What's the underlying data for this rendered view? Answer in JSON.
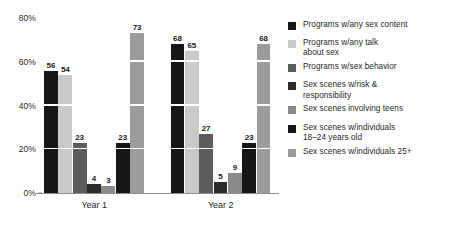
{
  "chart_data": {
    "type": "bar",
    "title": "",
    "subtitle": "",
    "xlabel": "",
    "ylabel": "",
    "ylim": [
      0,
      80
    ],
    "yticks": [
      0,
      20,
      40,
      60,
      80
    ],
    "ytick_labels": [
      "0%",
      "20%",
      "40%",
      "60%",
      "80%"
    ],
    "grid": true,
    "grid_color": "#ffffff",
    "legend_position": "right",
    "categories": [
      "Year 1",
      "Year 2"
    ],
    "series": [
      {
        "name": "Programs w/any sex content",
        "color": "#161616",
        "values": [
          56,
          68
        ],
        "labels": [
          "56",
          "68"
        ]
      },
      {
        "name": "Programs w/any talk\nabout sex",
        "color": "#c9c9c9",
        "values": [
          54,
          65
        ],
        "labels": [
          "54",
          "65"
        ]
      },
      {
        "name": "Programs w/sex behavior",
        "color": "#5c5c5c",
        "values": [
          23,
          27
        ],
        "labels": [
          "23",
          "27"
        ]
      },
      {
        "name": "Sex scenes w/risk &\nresponsibility",
        "color": "#2b2b2b",
        "values": [
          4,
          5
        ],
        "labels": [
          "4",
          "5"
        ]
      },
      {
        "name": "Sex scenes involving teens",
        "color": "#8a8a8a",
        "values": [
          3,
          9
        ],
        "labels": [
          "3",
          "9"
        ]
      },
      {
        "name": "Sex scenes w/individuals\n18–24 years old",
        "color": "#161616",
        "values": [
          23,
          23
        ],
        "labels": [
          "23",
          "23"
        ]
      },
      {
        "name": "Sex scenes w/individuals 25+",
        "color": "#9c9c9c",
        "values": [
          73,
          68
        ],
        "labels": [
          "73",
          "68"
        ]
      }
    ]
  },
  "axis": {
    "ticks": [
      {
        "label": "80%",
        "value": 80
      },
      {
        "label": "60%",
        "value": 60
      },
      {
        "label": "40%",
        "value": 40
      },
      {
        "label": "20%",
        "value": 20
      },
      {
        "label": "0%",
        "value": 0
      }
    ]
  },
  "groups": [
    {
      "label": "Year 1"
    },
    {
      "label": "Year 2"
    }
  ],
  "legend": {
    "items": [
      {
        "label": "Programs w/any sex content",
        "color": "#161616",
        "gap_after": 7
      },
      {
        "label": "Programs w/any talk\nabout sex",
        "color": "#c9c9c9",
        "gap_after": 3
      },
      {
        "label": "Programs w/sex behavior",
        "color": "#5c5c5c",
        "gap_after": 8
      },
      {
        "label": "Sex scenes w/risk &\nresponsibility",
        "color": "#2b2b2b",
        "gap_after": 3
      },
      {
        "label": "Sex scenes involving teens",
        "color": "#8a8a8a",
        "gap_after": 8
      },
      {
        "label": "Sex scenes w/individuals\n18–24 years old",
        "color": "#161616",
        "gap_after": 3
      },
      {
        "label": "Sex scenes w/individuals 25+",
        "color": "#9c9c9c",
        "gap_after": 0
      }
    ]
  }
}
